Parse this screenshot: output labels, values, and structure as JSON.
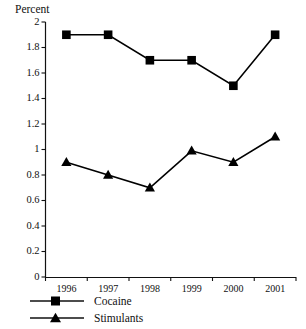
{
  "chart_data": {
    "type": "line",
    "title": "",
    "subtitle": "",
    "xlabel": "",
    "ylabel": "Percent",
    "categories": [
      "1996",
      "1997",
      "1998",
      "1999",
      "2000",
      "2001"
    ],
    "series": [
      {
        "name": "Cocaine",
        "marker": "square",
        "values": [
          1.9,
          1.9,
          1.7,
          1.7,
          1.5,
          1.9
        ]
      },
      {
        "name": "Stimulants",
        "marker": "triangle",
        "values": [
          0.9,
          0.8,
          0.7,
          0.99,
          0.9,
          1.1
        ]
      }
    ],
    "ylim": [
      0,
      2
    ],
    "ytick_values": [
      0,
      0.2,
      0.4,
      0.6,
      0.8,
      1,
      1.2,
      1.4,
      1.6,
      1.8,
      2
    ],
    "ytick_labels": [
      "0",
      "0.2",
      "0.4",
      "0.6",
      "0.8",
      "1",
      "1.2",
      "1.4",
      "1.6",
      "1.8",
      "2"
    ],
    "grid": false,
    "legend_position": "below-left",
    "line_color": "#000000",
    "marker_color": "#000000",
    "background_color": "#ffffff"
  },
  "axis": {
    "y_title": "Percent"
  },
  "legend": {
    "items": [
      {
        "label": "Cocaine"
      },
      {
        "label": "Stimulants"
      }
    ]
  }
}
